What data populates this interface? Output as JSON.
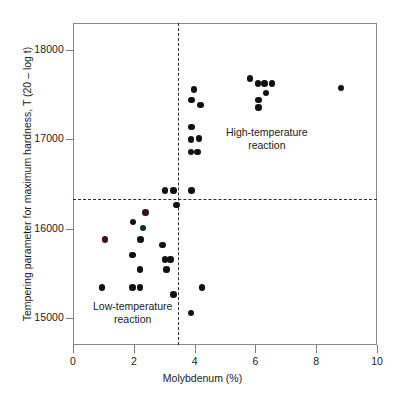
{
  "chart_data": {
    "type": "scatter",
    "title": "",
    "xlabel": "Molybdenum (%)",
    "ylabel": "Tempering parameter for maximum hardness, T (20 – log t)",
    "xlim": [
      0,
      10
    ],
    "ylim": [
      14700,
      18300
    ],
    "xticks": [
      0,
      2,
      4,
      6,
      8,
      10
    ],
    "xticklabels": [
      "0",
      "2",
      "4",
      "6",
      "8",
      "10"
    ],
    "yticks": [
      15000,
      16000,
      17000,
      18000
    ],
    "yticklabels": [
      "15000",
      "16000",
      "17000",
      "18000"
    ],
    "grid": false,
    "legend": "none",
    "annotations": [
      {
        "text_line1": "High-temperature",
        "text_line2": "reaction",
        "x": 6.05,
        "y": 16950
      },
      {
        "text_line1": "Low-temperature",
        "text_line2": "reaction",
        "x": 1.95,
        "y": 15060
      }
    ],
    "reference_lines": [
      {
        "orientation": "vertical",
        "value": 3.45,
        "style": "dashed"
      },
      {
        "orientation": "horizontal",
        "value": 16330,
        "style": "dashed"
      }
    ],
    "points": [
      {
        "x": 0.95,
        "y": 15345
      },
      {
        "x": 1.05,
        "y": 15880,
        "tint": "red"
      },
      {
        "x": 1.95,
        "y": 15345
      },
      {
        "x": 1.95,
        "y": 15705
      },
      {
        "x": 1.98,
        "y": 16075
      },
      {
        "x": 2.2,
        "y": 15345
      },
      {
        "x": 2.2,
        "y": 15545
      },
      {
        "x": 2.22,
        "y": 15880
      },
      {
        "x": 2.3,
        "y": 16010,
        "tint": "green"
      },
      {
        "x": 2.38,
        "y": 16180,
        "tint": "red"
      },
      {
        "x": 2.95,
        "y": 15820
      },
      {
        "x": 3.02,
        "y": 15655
      },
      {
        "x": 3.02,
        "y": 16425
      },
      {
        "x": 3.08,
        "y": 15545
      },
      {
        "x": 3.2,
        "y": 15655
      },
      {
        "x": 3.3,
        "y": 15265
      },
      {
        "x": 3.3,
        "y": 16425
      },
      {
        "x": 3.4,
        "y": 16265
      },
      {
        "x": 3.88,
        "y": 15060
      },
      {
        "x": 3.88,
        "y": 16855
      },
      {
        "x": 3.88,
        "y": 17000
      },
      {
        "x": 3.9,
        "y": 16425
      },
      {
        "x": 3.9,
        "y": 17140
      },
      {
        "x": 3.9,
        "y": 17440
      },
      {
        "x": 3.98,
        "y": 17555
      },
      {
        "x": 4.1,
        "y": 16855
      },
      {
        "x": 4.15,
        "y": 17010
      },
      {
        "x": 4.2,
        "y": 17385
      },
      {
        "x": 4.25,
        "y": 15345
      },
      {
        "x": 5.82,
        "y": 17680
      },
      {
        "x": 6.08,
        "y": 17625
      },
      {
        "x": 6.1,
        "y": 17440
      },
      {
        "x": 6.1,
        "y": 17355
      },
      {
        "x": 6.3,
        "y": 17625
      },
      {
        "x": 6.35,
        "y": 17520
      },
      {
        "x": 6.55,
        "y": 17625
      },
      {
        "x": 8.82,
        "y": 17575
      }
    ]
  },
  "axis": {
    "x_title": "Molybdenum (%)",
    "y_title": "Tempering parameter for maximum hardness, T (20 – log t)"
  },
  "labels": {
    "high_temp_line1": "High-temperature",
    "high_temp_line2": "reaction",
    "low_temp_line1": "Low-temperature",
    "low_temp_line2": "reaction"
  }
}
